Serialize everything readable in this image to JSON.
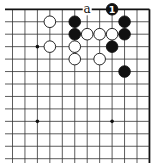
{
  "diagram": {
    "type": "go-board-fragment",
    "grid": {
      "origin_x": 12.5,
      "origin_y": 9.3,
      "spacing": 12.45,
      "cols": 12,
      "rows": 13,
      "top_edge": true,
      "right_edge": true,
      "line_color": "#333333",
      "edge_color": "#111111"
    },
    "star_points": [
      {
        "col": 2,
        "row": 3
      },
      {
        "col": 2,
        "row": 9
      },
      {
        "col": 8,
        "row": 9
      }
    ],
    "stones": [
      {
        "color": "white",
        "col": 3,
        "row": 1
      },
      {
        "color": "black",
        "col": 5,
        "row": 1
      },
      {
        "color": "black",
        "col": 9,
        "row": 1
      },
      {
        "color": "black",
        "col": 8,
        "row": 0,
        "label": "1"
      },
      {
        "color": "black",
        "col": 5,
        "row": 2
      },
      {
        "color": "white",
        "col": 6,
        "row": 2
      },
      {
        "color": "white",
        "col": 7,
        "row": 2
      },
      {
        "color": "white",
        "col": 8,
        "row": 2
      },
      {
        "color": "black",
        "col": 9,
        "row": 2
      },
      {
        "color": "white",
        "col": 3,
        "row": 3
      },
      {
        "color": "white",
        "col": 5,
        "row": 3
      },
      {
        "color": "black",
        "col": 8,
        "row": 3
      },
      {
        "color": "white",
        "col": 5,
        "row": 4
      },
      {
        "color": "white",
        "col": 7,
        "row": 4
      },
      {
        "color": "black",
        "col": 9,
        "row": 5
      }
    ],
    "labels": [
      {
        "text": "a",
        "col": 6,
        "row": 0
      }
    ]
  }
}
